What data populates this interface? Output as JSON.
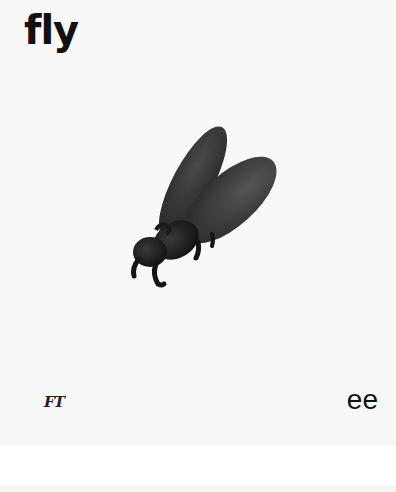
{
  "card": {
    "word": "fly",
    "illustration": {
      "subject": "fly-illustration",
      "body_color": "#2a2a2a",
      "wing_color": "#3a3a3a"
    },
    "bottom_left_glyph": "FT",
    "bottom_right_letters": "ee"
  },
  "colors": {
    "card_background": "#f8f8f8",
    "page_background": "#ffffff",
    "text": "#111111"
  }
}
